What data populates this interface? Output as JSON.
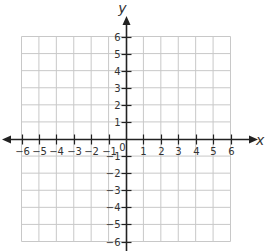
{
  "chart_data": {
    "type": "scatter",
    "title": "",
    "xlabel": "x",
    "ylabel": "y",
    "xlim": [
      -6,
      6
    ],
    "ylim": [
      -6,
      6
    ],
    "grid": true,
    "x_ticks": [
      -6,
      -5,
      -4,
      -3,
      -2,
      -1,
      1,
      2,
      3,
      4,
      5,
      6
    ],
    "y_ticks": [
      -6,
      -5,
      -4,
      -3,
      -2,
      -1,
      1,
      2,
      3,
      4,
      5,
      6
    ],
    "x_tick_labels": [
      "−6",
      "−5",
      "−4",
      "−3",
      "−2",
      "−1",
      "1",
      "2",
      "3",
      "4",
      "5",
      "6"
    ],
    "y_tick_labels": [
      "−6",
      "−5",
      "−4",
      "−3",
      "−2",
      "−1",
      "1",
      "2",
      "3",
      "4",
      "5",
      "6"
    ],
    "origin_label": "0",
    "points": [],
    "colors": {
      "grid": "#c8c8c8",
      "axis": "#222222",
      "text": "#333333"
    }
  }
}
